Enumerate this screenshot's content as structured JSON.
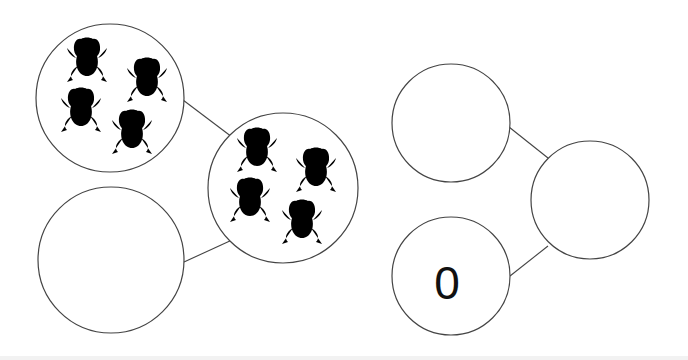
{
  "diagrams": [
    {
      "name": "left-bond",
      "parts": [
        {
          "id": "part-top",
          "frog_count": 4,
          "value": ""
        },
        {
          "id": "part-bottom",
          "frog_count": 0,
          "value": ""
        }
      ],
      "whole": {
        "id": "whole",
        "frog_count": 4,
        "value": ""
      }
    },
    {
      "name": "right-bond",
      "parts": [
        {
          "id": "part-top",
          "frog_count": 0,
          "value": ""
        },
        {
          "id": "part-bottom",
          "frog_count": 0,
          "value": "0"
        }
      ],
      "whole": {
        "id": "whole",
        "frog_count": 0,
        "value": ""
      }
    }
  ],
  "icons": {
    "frog": "frog-icon"
  },
  "colors": {
    "stroke": "#444444",
    "background": "#ffffff",
    "text": "#111111"
  }
}
